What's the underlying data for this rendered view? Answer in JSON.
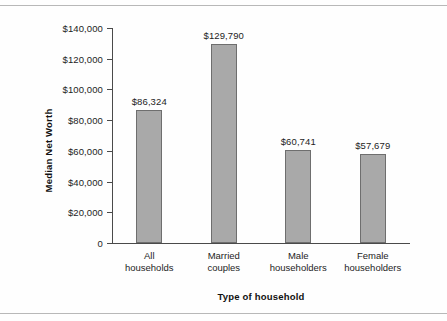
{
  "chart_data": {
    "type": "bar",
    "title": "",
    "xlabel": "Type of household",
    "ylabel": "Median Net Worth",
    "categories": [
      "All households",
      "Married couples",
      "Male householders",
      "Female householders"
    ],
    "category_lines": [
      [
        "All",
        "households"
      ],
      [
        "Married",
        "couples"
      ],
      [
        "Male",
        "householders"
      ],
      [
        "Female",
        "householders"
      ]
    ],
    "values": [
      86324,
      129790,
      60741,
      57679
    ],
    "value_labels": [
      "$86,324",
      "$129,790",
      "$60,741",
      "$57,679"
    ],
    "ylim": [
      0,
      140000
    ],
    "ytick_values": [
      0,
      20000,
      40000,
      60000,
      80000,
      100000,
      120000,
      140000
    ],
    "ytick_labels": [
      "0",
      "$20,000",
      "$40,000",
      "$60,000",
      "$80,000",
      "$100,000",
      "$120,000",
      "$140,000"
    ],
    "grid": false,
    "legend": false,
    "bar_color": "#a9a9a9",
    "bar_edge_color": "#6e6e6e",
    "axis_color": "#4a4a4a"
  }
}
